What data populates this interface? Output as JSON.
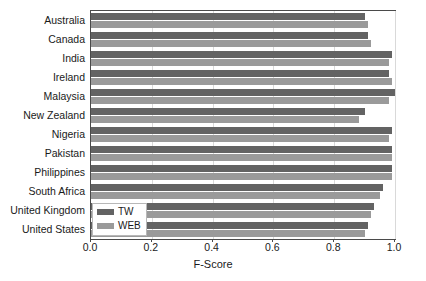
{
  "chart_data": {
    "type": "bar",
    "orientation": "horizontal",
    "title": "",
    "xlabel": "F-Score",
    "ylabel": "",
    "xlim": [
      0.0,
      1.0
    ],
    "xticks": [
      "0.0",
      "0.2",
      "0.4",
      "0.6",
      "0.8",
      "1.0"
    ],
    "xtick_values": [
      0.0,
      0.2,
      0.4,
      0.6,
      0.8,
      1.0
    ],
    "grid": true,
    "grid_axis": "x",
    "legend_position": "lower left",
    "categories": [
      "Australia",
      "Canada",
      "India",
      "Ireland",
      "Malaysia",
      "New Zealand",
      "Nigeria",
      "Pakistan",
      "Philippines",
      "South Africa",
      "United Kingdom",
      "United States"
    ],
    "series": [
      {
        "name": "TW",
        "color": "#636363",
        "values": [
          0.9,
          0.91,
          0.99,
          0.98,
          1.0,
          0.9,
          0.99,
          0.99,
          0.99,
          0.96,
          0.93,
          0.91
        ]
      },
      {
        "name": "WEB",
        "color": "#9a9a9a",
        "values": [
          0.91,
          0.92,
          0.98,
          0.99,
          0.98,
          0.88,
          0.98,
          0.99,
          0.99,
          0.95,
          0.92,
          0.9
        ]
      }
    ]
  },
  "legend": {
    "entries": [
      {
        "label": "TW",
        "color": "#636363"
      },
      {
        "label": "WEB",
        "color": "#9a9a9a"
      }
    ]
  },
  "colors": {
    "tw": "#636363",
    "web": "#9a9a9a",
    "grid": "#d9d9d9",
    "axis": "#4a4a4a",
    "text": "#1a1a1a",
    "background": "#ffffff"
  }
}
